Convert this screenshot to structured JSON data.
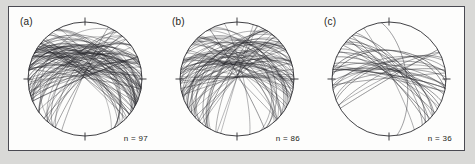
{
  "figure": {
    "type": "stereonet-triptych",
    "background_color": "#d9d9d7",
    "frame_color": "#4a4a52",
    "plot_background": "#fdfdfc",
    "line_color": "#2b2b30"
  },
  "panels": [
    {
      "id": "a",
      "label": "(a)",
      "count_label": "n = 97",
      "n": 97,
      "radius": 57,
      "center_x": 76,
      "center_y": 73,
      "seed": 1731,
      "density": "very-dense",
      "dip_min": 18,
      "dip_max": 90,
      "strike_center": 95,
      "strike_spread": 62,
      "line_width": 0.42,
      "opacity": 0.82
    },
    {
      "id": "b",
      "label": "(b)",
      "count_label": "n = 86",
      "n": 86,
      "radius": 57,
      "center_x": 76,
      "center_y": 73,
      "seed": 9042,
      "density": "dense",
      "dip_min": 22,
      "dip_max": 90,
      "strike_center": 85,
      "strike_spread": 70,
      "line_width": 0.42,
      "opacity": 0.8
    },
    {
      "id": "c",
      "label": "(c)",
      "count_label": "n = 36",
      "n": 36,
      "radius": 57,
      "center_x": 76,
      "center_y": 73,
      "seed": 4415,
      "density": "sparse",
      "dip_min": 42,
      "dip_max": 90,
      "strike_center": 100,
      "strike_spread": 48,
      "line_width": 0.48,
      "opacity": 0.86
    }
  ],
  "chart_data": {
    "type": "scatter",
    "title": "",
    "xlabel": "",
    "ylabel": "",
    "projection": "equal-area lower-hemisphere stereographic projection",
    "plotted_element": "great circles (planes)",
    "tick_marks": [
      "N",
      "E",
      "S",
      "W"
    ],
    "series": [
      {
        "name": "(a)",
        "n_planes": 97,
        "annotation": "n = 97"
      },
      {
        "name": "(b)",
        "n_planes": 86,
        "annotation": "n = 86"
      },
      {
        "name": "(c)",
        "n_planes": 36,
        "annotation": "n = 36"
      }
    ]
  }
}
